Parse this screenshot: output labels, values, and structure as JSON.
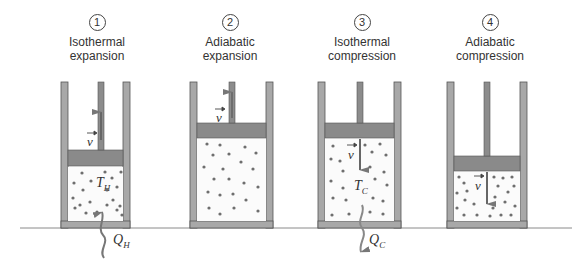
{
  "figure": {
    "colors": {
      "wall": "#a8a8a8",
      "wall_edge": "#555555",
      "piston": "#8a8a8a",
      "rod": "#8c8c8c",
      "gas_bg": "#fbfbfb",
      "molecule": "#6e6e6e",
      "arrow": "#777777",
      "ground": "#8a8a8a"
    },
    "stages": [
      {
        "number": "1",
        "line1": "Isothermal",
        "line2": "expansion",
        "temp_label": "T",
        "temp_sub": "H",
        "heat_label": "Q",
        "heat_sub": "H",
        "velocity_label": "v",
        "heat_direction": "in"
      },
      {
        "number": "2",
        "line1": "Adiabatic",
        "line2": "expansion",
        "velocity_label": "v"
      },
      {
        "number": "3",
        "line1": "Isothermal",
        "line2": "compression",
        "temp_label": "T",
        "temp_sub": "C",
        "heat_label": "Q",
        "heat_sub": "C",
        "velocity_label": "v",
        "heat_direction": "out"
      },
      {
        "number": "4",
        "line1": "Adiabatic",
        "line2": "compression",
        "velocity_label": "v"
      }
    ]
  }
}
